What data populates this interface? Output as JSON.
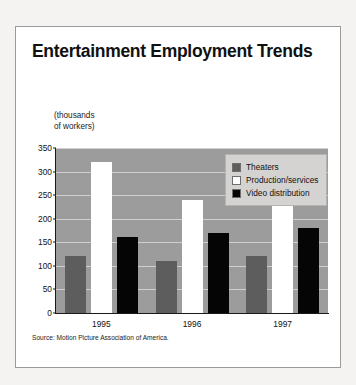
{
  "figure": {
    "title": "Entertainment Employment Trends",
    "source": "Source: Motion Picture Association of America.",
    "axis_caption": "(thousands\nof workers)",
    "colors": {
      "plot_background": "#9c9c9c",
      "gridline": "#cfcfcf",
      "theaters": "#5d5d5d",
      "production": "#ffffff",
      "video": "#050505",
      "legend_background": "#d4d3d1",
      "frame_border": "#9a9a9a"
    }
  },
  "chart_data": {
    "type": "bar",
    "title": "Entertainment Employment Trends",
    "subtitle": "",
    "xlabel": "",
    "ylabel": "(thousands of workers)",
    "categories": [
      "1995",
      "1996",
      "1997"
    ],
    "series": [
      {
        "name": "Theaters",
        "values": [
          120,
          110,
          120
        ],
        "color": "#5d5d5d"
      },
      {
        "name": "Production/services",
        "values": [
          320,
          240,
          240
        ],
        "color": "#ffffff"
      },
      {
        "name": "Video distribution",
        "values": [
          162,
          170,
          180
        ],
        "color": "#050505"
      }
    ],
    "ylim": [
      0,
      350
    ],
    "yticks": [
      0,
      50,
      100,
      150,
      200,
      250,
      300,
      350
    ],
    "ytick_labels": [
      "0",
      "50",
      "100",
      "150",
      "200",
      "250",
      "300",
      "350"
    ],
    "grid": true,
    "legend_position": "top-right",
    "annotations": [
      "Source: Motion Picture Association of America."
    ]
  }
}
